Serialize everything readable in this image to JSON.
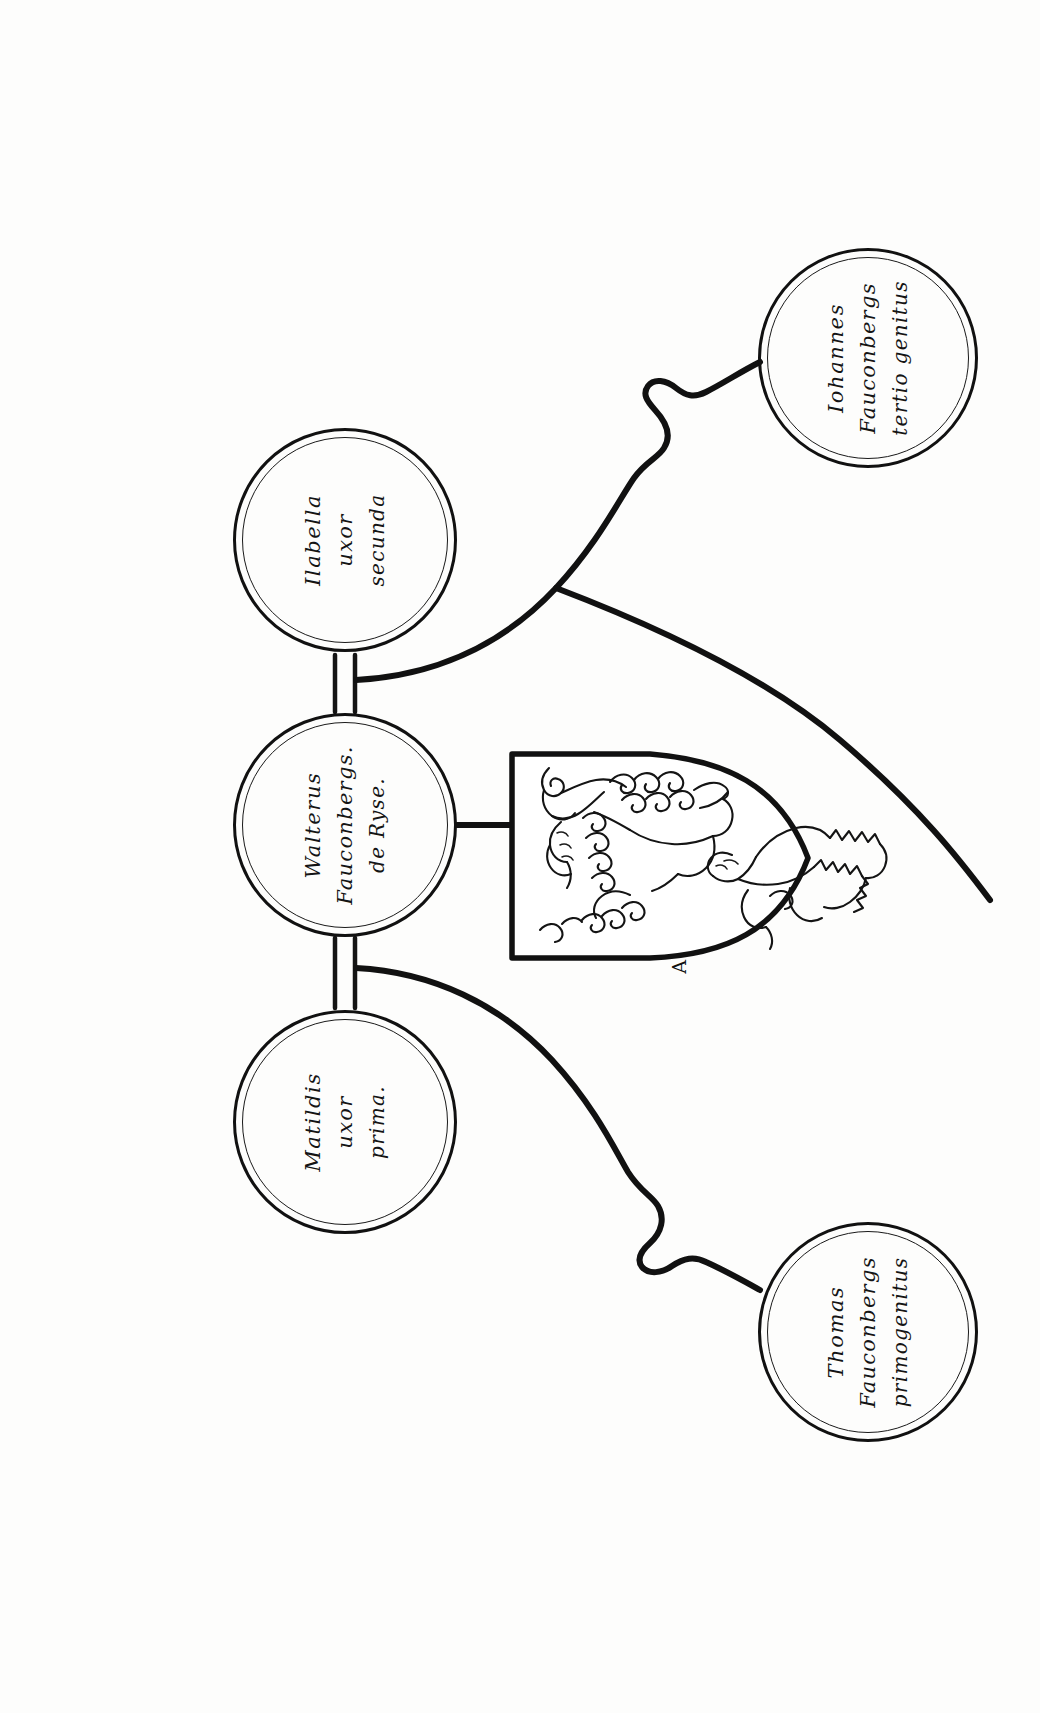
{
  "document": {
    "kind": "heraldic-pedigree-chart",
    "title": "Fauconberg de Ryse pedigree roundel chart",
    "background_color": "#fdfdfc",
    "ink_color": "#111111",
    "orientation": "text rotated 90 degrees counter-clockwise"
  },
  "nodes": {
    "principal": {
      "id": "walterus-fauconbergs-de-ryse",
      "role": "principal",
      "lines": [
        "Walterus",
        "Fauconbergs.",
        "de Ryse."
      ],
      "line1": "Walterus",
      "line2": "Fauconbergs.",
      "line3": "de Ryse.",
      "center_x": 345,
      "center_y": 825,
      "radius": 112
    },
    "wife_second": {
      "id": "ilabella-uxor-secunda",
      "role": "second-wife",
      "lines": [
        "Ilabella",
        "uxor",
        "secunda"
      ],
      "line1": "Ilabella",
      "line2": "uxor",
      "line3": "secunda",
      "center_x": 345,
      "center_y": 540,
      "radius": 112
    },
    "wife_first": {
      "id": "matildis-uxor-prima",
      "role": "first-wife",
      "lines": [
        "Matildis",
        "uxor",
        "prima."
      ],
      "line1": "Matildis",
      "line2": "uxor",
      "line3": "prima.",
      "center_x": 345,
      "center_y": 1122,
      "radius": 112
    },
    "child_third": {
      "id": "iohannes-fauconbergs-tertio-genitus",
      "role": "third-son",
      "lines": [
        "Iohannes",
        "Fauconbergs",
        "tertio genitus"
      ],
      "line1": "Iohannes",
      "line2": "Fauconbergs",
      "line3": "tertio genitus",
      "center_x": 868,
      "center_y": 358,
      "radius": 110
    },
    "child_first": {
      "id": "thomas-fauconbergs-primogenitus",
      "role": "first-born-son",
      "lines": [
        "Thomas",
        "Fauconbergs",
        "primogenitus"
      ],
      "line1": "Thomas",
      "line2": "Fauconbergs",
      "line3": "primogenitus",
      "center_x": 868,
      "center_y": 1332,
      "radius": 110
    }
  },
  "shield": {
    "id": "coat-of-arms-fauconberg",
    "description": "escutcheon charged with two lions rampant",
    "charge_count": 2,
    "charge_name": "lion rampant",
    "annotation_mark": "A",
    "tincture_field": "#ffffff",
    "outline_color": "#111111"
  },
  "connectors": [
    {
      "id": "marriage-bar-second-wife",
      "from": "principal",
      "to": "wife_second",
      "style": "double-bar"
    },
    {
      "id": "marriage-bar-first-wife",
      "from": "principal",
      "to": "wife_first",
      "style": "double-bar"
    },
    {
      "id": "descent-brace-upper",
      "from": "wife_second",
      "to": "child_third",
      "style": "curved-brace-with-crook"
    },
    {
      "id": "descent-brace-lower",
      "from": "wife_first",
      "to": "child_first",
      "style": "curved-brace-with-crook"
    },
    {
      "id": "shield-tie",
      "from": "principal",
      "to": "shield",
      "style": "straight-bar"
    }
  ]
}
